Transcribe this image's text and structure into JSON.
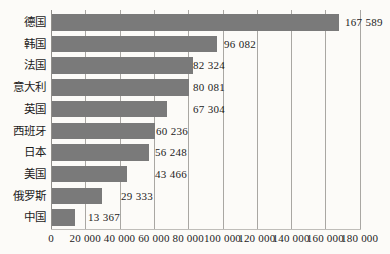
{
  "chart_data": {
    "type": "bar",
    "orientation": "horizontal",
    "title": "",
    "categories": [
      "德国",
      "韩国",
      "法国",
      "意大利",
      "英国",
      "西班牙",
      "日本",
      "美国",
      "俄罗斯",
      "中国"
    ],
    "values": [
      167589,
      96082,
      82324,
      80081,
      67304,
      60236,
      56248,
      43466,
      29333,
      13367
    ],
    "value_labels": [
      "167 589",
      "96 082",
      "82 324",
      "80 081",
      "67 304",
      "60 236",
      "56 248",
      "43 466",
      "29 333",
      "13 367"
    ],
    "x_ticks": [
      0,
      20000,
      40000,
      60000,
      80000,
      100000,
      120000,
      140000,
      160000,
      180000
    ],
    "x_tick_labels": [
      "0",
      "20 000",
      "40 000",
      "60 000",
      "80 000",
      "100 000",
      "120 000",
      "140 000",
      "160 000",
      "180 000"
    ],
    "xlim": [
      0,
      180000
    ],
    "grid": "vertical-gridlines",
    "legend": "none",
    "bar_color": "#7a7a7a",
    "background_color": "#fcfbf8",
    "value_label_x_px": [
      345,
      224,
      193,
      193,
      193,
      156,
      155,
      155,
      121,
      88
    ]
  }
}
